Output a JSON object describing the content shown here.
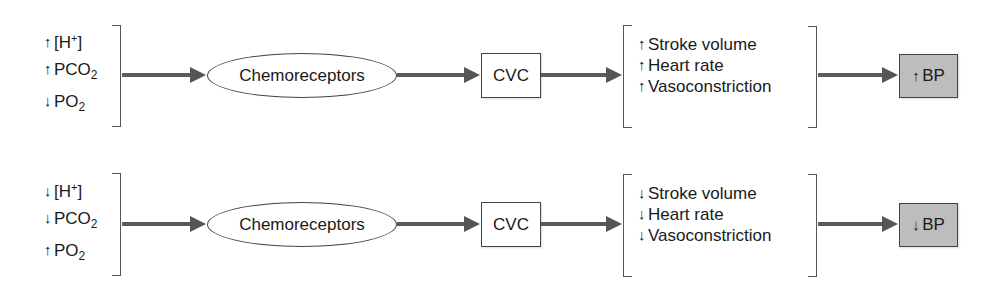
{
  "rows": [
    {
      "id": "increase",
      "inputs": [
        {
          "direction": "up",
          "arrow": "↑",
          "label_pre": "[H",
          "sup": "+",
          "label_post": "]",
          "sub": ""
        },
        {
          "direction": "up",
          "arrow": "↑",
          "label_pre": "PCO",
          "sup": "",
          "label_post": "",
          "sub": "2"
        },
        {
          "direction": "down",
          "arrow": "↓",
          "label_pre": "PO",
          "sup": "",
          "label_post": "",
          "sub": "2"
        }
      ],
      "receptor": "Chemoreceptors",
      "center": "CVC",
      "effects": [
        {
          "direction": "up",
          "arrow": "↑",
          "label": "Stroke volume"
        },
        {
          "direction": "up",
          "arrow": "↑",
          "label": "Heart rate"
        },
        {
          "direction": "up",
          "arrow": "↑",
          "label": "Vasoconstriction"
        }
      ],
      "outcome": {
        "direction": "up",
        "arrow": "↑",
        "label": "BP"
      }
    },
    {
      "id": "decrease",
      "inputs": [
        {
          "direction": "down",
          "arrow": "↓",
          "label_pre": "[H",
          "sup": "+",
          "label_post": "]",
          "sub": ""
        },
        {
          "direction": "down",
          "arrow": "↓",
          "label_pre": "PCO",
          "sup": "",
          "label_post": "",
          "sub": "2"
        },
        {
          "direction": "up",
          "arrow": "↑",
          "label_pre": "PO",
          "sup": "",
          "label_post": "",
          "sub": "2"
        }
      ],
      "receptor": "Chemoreceptors",
      "center": "CVC",
      "effects": [
        {
          "direction": "down",
          "arrow": "↓",
          "label": "Stroke volume"
        },
        {
          "direction": "down",
          "arrow": "↓",
          "label": "Heart rate"
        },
        {
          "direction": "down",
          "arrow": "↓",
          "label": "Vasoconstriction"
        }
      ],
      "outcome": {
        "direction": "down",
        "arrow": "↓",
        "label": "BP"
      }
    }
  ],
  "colors": {
    "outcome_fill": "#bdbdbd",
    "arrow": "#555555",
    "stroke": "#444444"
  }
}
